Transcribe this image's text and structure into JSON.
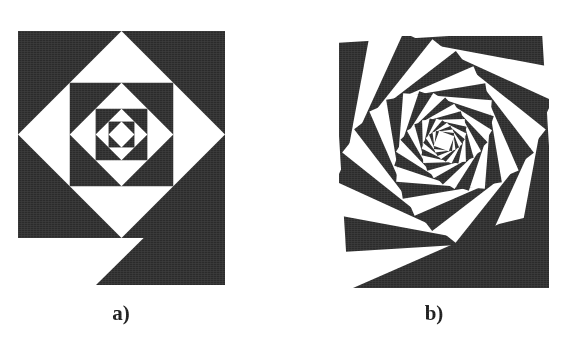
{
  "figure": {
    "background_color": "#ffffff",
    "ink_color": "#2b2b2b",
    "paper_color": "#ffffff",
    "caption_color": "#1a1a1a",
    "panels": [
      {
        "id": "a",
        "label": "a)",
        "title_alt": "Nested square spiral, 45 degree step, no shear",
        "origin": {
          "x": 18,
          "y": 31
        },
        "size": {
          "width": 207,
          "height": 254
        },
        "square_side": 207,
        "overhang_triangle": true,
        "rotation_step_deg": 45,
        "scale_step": 0.7071,
        "levels": 8,
        "start_fill": "#2b2b2b",
        "alternate_fill": "#ffffff"
      },
      {
        "id": "b",
        "label": "b)",
        "title_alt": "Rotating square spiral, small angle step, whirl effect",
        "origin": {
          "x": 54,
          "y": 36
        },
        "size": {
          "width": 210,
          "height": 252
        },
        "square_side": 209,
        "overhang_triangle": true,
        "rotation_step_deg": 14,
        "scale_step": 0.885,
        "levels": 22,
        "start_fill": "#2b2b2b",
        "alternate_fill": "#ffffff"
      }
    ]
  },
  "chart_data": {
    "type": "diagram",
    "title": "",
    "subtitle": "",
    "annotations": [
      "a)",
      "b)"
    ],
    "panels": [
      {
        "label": "a)",
        "description": "Self-similar nested squares; each inner square is inscribed in the previous one by joining midpoints of its edges, producing a 45 degree rotation per level and a scale factor of 1/sqrt(2). Fill alternates black and white at every level, yielding a radial checker/diamond rosette. A black right triangle spills out below-right of the bounding square.",
        "rotation_step_deg": 45,
        "scale_step": 0.7071,
        "levels": 8
      },
      {
        "label": "b)",
        "description": "Self-similar nested squares inscribed with a small offset along each edge, giving a constant small rotation per level and a scale factor near 0.885. Fill alternates black and white at every level, producing a whirling/vortex spiral. A thin black wedge spills out below the bounding square.",
        "rotation_step_deg": 14,
        "scale_step": 0.885,
        "levels": 22
      }
    ]
  }
}
